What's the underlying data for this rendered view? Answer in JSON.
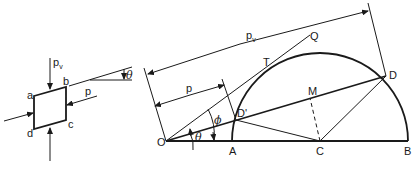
{
  "figure": {
    "element_diagram": {
      "corners": {
        "a": "a",
        "b": "b",
        "c": "c",
        "d": "d"
      },
      "labels": {
        "pv": "p",
        "pv_sub": "v",
        "p": "p",
        "theta": "θ"
      }
    },
    "mohr_construction": {
      "points": {
        "O": "O",
        "A": "A",
        "C": "C",
        "B": "B",
        "D": "D",
        "D_prime": "D'",
        "M": "M",
        "T": "T",
        "Q": "Q"
      },
      "dimensions": {
        "pv": "p",
        "pv_sub": "v",
        "p": "p"
      },
      "angles": {
        "phi": "ϕ",
        "theta": "θ"
      }
    },
    "colors": {
      "ink": "#1a1a1a",
      "background": "#ffffff"
    }
  }
}
